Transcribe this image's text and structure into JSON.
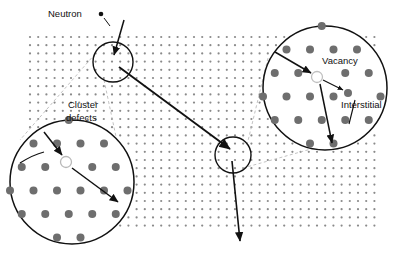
{
  "figure": {
    "background_color": "#ffffff",
    "lattice_dot_color": "#8a8a8a",
    "atom_color": "#6e6e6e",
    "vacancy_fill": "#ffffff",
    "outline_color": "#111111",
    "connector_color": "#b0b0b0"
  },
  "labels": {
    "neutron": "Neutron",
    "cluster_defects_line1": "Cluster",
    "cluster_defects_line2": "defects",
    "vacancy": "Vacancy",
    "interstitial": "Interstitial"
  },
  "lattice": {
    "x": 30,
    "y": 37,
    "width": 350,
    "height": 196,
    "spacing": 8.2,
    "dot_radius": 1.1
  },
  "damage_sites": [
    {
      "name": "primary-knock-on-site",
      "cx": 113,
      "cy": 62,
      "r": 20
    },
    {
      "name": "secondary-cascade-site",
      "cx": 233,
      "cy": 155,
      "r": 18
    }
  ],
  "magnifiers": [
    {
      "name": "cluster-defects-magnifier",
      "cx": 72,
      "cy": 182,
      "r": 62,
      "source_site": "primary-knock-on-site",
      "vacancy": {
        "cx": 66,
        "cy": 162,
        "r": 5.5
      },
      "atom_radius": 4.0
    },
    {
      "name": "vacancy-interstitial-magnifier",
      "cx": 325,
      "cy": 88,
      "r": 62,
      "source_site": "secondary-cascade-site",
      "vacancy": {
        "cx": 317,
        "cy": 77,
        "r": 5.5
      },
      "interstitial": {
        "cx": 347,
        "cy": 93,
        "r": 4.0
      },
      "atom_radius": 4.0
    }
  ],
  "trajectories": [
    {
      "name": "incoming-neutron-path",
      "x1": 122,
      "y1": 22,
      "x2": 113,
      "y2": 57
    },
    {
      "name": "scattered-neutron-path",
      "x1": 118,
      "y1": 66,
      "x2": 231,
      "y2": 150
    },
    {
      "name": "recoil-exit-path",
      "x1": 233,
      "y1": 160,
      "x2": 240,
      "y2": 243
    }
  ],
  "marker_dot": {
    "name": "neutron-marker-dot",
    "cx": 101,
    "cy": 14,
    "r": 2.3
  }
}
